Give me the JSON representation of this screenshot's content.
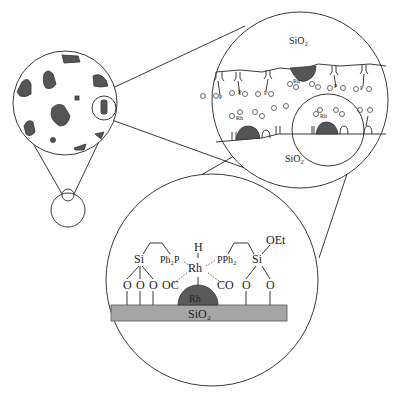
{
  "panels": {
    "upper_right": {
      "top_label": "SiO₂",
      "bottom_label": "SiO₂",
      "complex_labels": [
        "Rh",
        "Rh",
        "Rh"
      ],
      "ligand_label": "P"
    },
    "bottom": {
      "substrate_label": "SiO₂",
      "particle_label": "Rh",
      "left_si": "Si",
      "right_si": "Si",
      "ethoxy": "OEt",
      "left_phosphine": "Ph₂P",
      "right_phosphine": "PPh₂",
      "metal_center": "Rh",
      "hydride": "H",
      "left_carbonyl": "OC",
      "right_carbonyl": "CO",
      "oxygen": "O"
    }
  },
  "colors": {
    "line": "#3a3a3a",
    "particle": "#555555",
    "substrate": "#a6a6a6"
  }
}
